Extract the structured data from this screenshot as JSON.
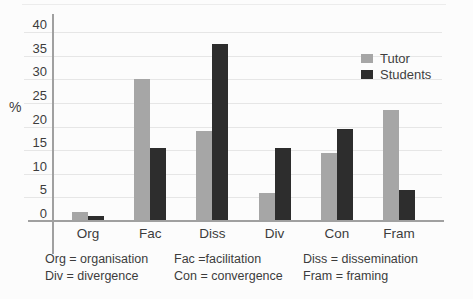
{
  "figure": {
    "background": "#fcfcfc",
    "text_color": "#3c3c3c",
    "axis_color": "#a0a0a0",
    "gridline_color": "#e6e6e6"
  },
  "chart_data": {
    "type": "bar",
    "title": "",
    "xlabel": "",
    "ylabel": "%",
    "categories": [
      "Org",
      "Fac",
      "Diss",
      "Div",
      "Con",
      "Fram"
    ],
    "series": [
      {
        "name": "Tutor",
        "color": "#a6a6a6",
        "values": [
          2,
          30,
          19,
          6,
          14.5,
          23.5
        ]
      },
      {
        "name": "Students",
        "color": "#2d2d2d",
        "values": [
          1,
          15.5,
          37.5,
          15.5,
          19.5,
          6.5
        ]
      }
    ],
    "ylim": [
      0,
      40
    ],
    "yticks": [
      0,
      5,
      10,
      15,
      20,
      25,
      30,
      35,
      40
    ],
    "grid": true,
    "legend_position": "top-right"
  },
  "footnotes": {
    "col1": [
      "Org = organisation",
      "Div = divergence"
    ],
    "col2": [
      "Fac =facilitation",
      "Con = convergence"
    ],
    "col3": [
      "Diss = dissemination",
      "Fram = framing"
    ]
  }
}
